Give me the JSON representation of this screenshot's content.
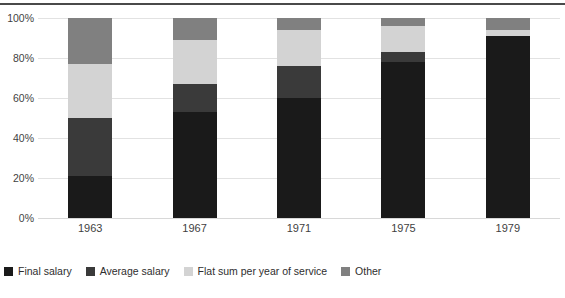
{
  "chart_data": {
    "type": "bar",
    "stacked": true,
    "stack_mode": "percent",
    "title": "",
    "subtitle": "",
    "xlabel": "",
    "ylabel": "",
    "categories": [
      "1963",
      "1967",
      "1971",
      "1975",
      "1979"
    ],
    "ytick_labels": [
      "0%",
      "20%",
      "40%",
      "60%",
      "80%",
      "100%"
    ],
    "ytick_values": [
      0,
      20,
      40,
      60,
      80,
      100
    ],
    "ylim": [
      0,
      100
    ],
    "grid": true,
    "legend_position": "bottom",
    "series": [
      {
        "name": "Final salary",
        "color": "#1a1a1a",
        "values": [
          21,
          53,
          60,
          78,
          91
        ]
      },
      {
        "name": "Average salary",
        "color": "#3a3a3a",
        "values": [
          29,
          14,
          16,
          5,
          0
        ]
      },
      {
        "name": "Flat sum per year of service",
        "color": "#d3d3d3",
        "values": [
          27,
          22,
          18,
          13,
          3
        ]
      },
      {
        "name": "Other",
        "color": "#808080",
        "values": [
          23,
          11,
          6,
          4,
          6
        ]
      }
    ]
  },
  "axis": {
    "y_ticks": [
      {
        "label": "100%",
        "value": 100
      },
      {
        "label": "80%",
        "value": 80
      },
      {
        "label": "60%",
        "value": 60
      },
      {
        "label": "40%",
        "value": 40
      },
      {
        "label": "20%",
        "value": 20
      },
      {
        "label": "0%",
        "value": 0
      }
    ],
    "x_ticks": [
      "1963",
      "1967",
      "1971",
      "1975",
      "1979"
    ]
  },
  "legend": {
    "items": [
      {
        "label": "Final salary",
        "color": "#1a1a1a"
      },
      {
        "label": "Average salary",
        "color": "#3a3a3a"
      },
      {
        "label": "Flat sum per year of service",
        "color": "#d3d3d3"
      },
      {
        "label": "Other",
        "color": "#808080"
      }
    ]
  }
}
